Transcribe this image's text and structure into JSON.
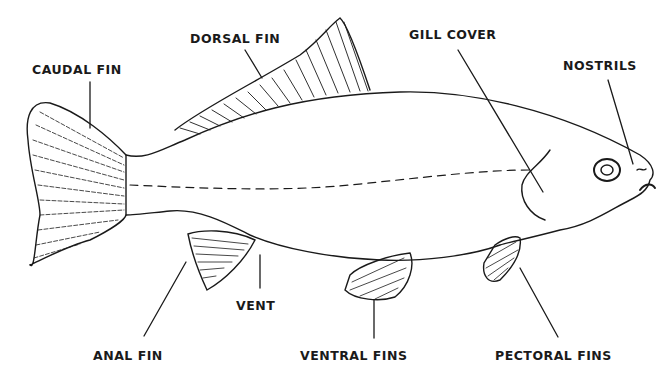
{
  "diagram": {
    "labels": {
      "caudal_fin": "CAUDAL FIN",
      "dorsal_fin": "DORSAL FIN",
      "gill_cover": "GILL COVER",
      "nostrils": "NOSTRILS",
      "anal_fin": "ANAL FIN",
      "vent": "VENT",
      "ventral_fins": "VENTRAL FINS",
      "pectoral_fins": "PECTORAL FINS"
    },
    "colors": {
      "ink": "#1a1a1a",
      "background": "#ffffff"
    }
  }
}
